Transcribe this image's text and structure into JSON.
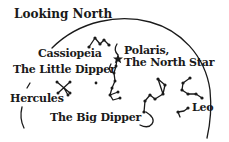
{
  "diagram": {
    "title": "Looking North",
    "ink_color": "#1a1a1a",
    "background": "#ffffff",
    "labels": {
      "cassiopeia": "Cassiopeia",
      "polaris_line1": "Polaris,",
      "polaris_line2": "The North Star",
      "little_dipper": "The Little Dipper",
      "hercules": "Hercules",
      "big_dipper": "The Big Dipper",
      "leo": "Leo"
    },
    "constellations": [
      "Cassiopeia",
      "Little Dipper",
      "Polaris",
      "Hercules",
      "Big Dipper",
      "Leo"
    ]
  }
}
